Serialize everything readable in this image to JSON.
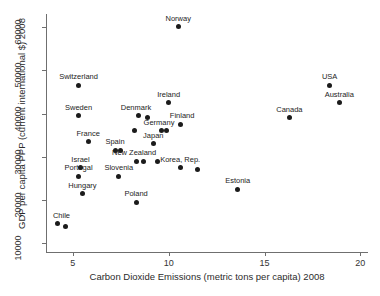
{
  "chart_data": {
    "type": "scatter",
    "title": "",
    "xlabel": "Carbon Dioxide Emissions (metric tons per capita) 2008",
    "ylabel": "GDP per capita PPP (current international $) 2008",
    "xlim": [
      3.6,
      20.4
    ],
    "ylim": [
      8000,
      63000
    ],
    "xticks": [
      5,
      10,
      15,
      20
    ],
    "xticklabels": [
      "5",
      "10",
      "15",
      "20"
    ],
    "yticks": [
      10000,
      20000,
      30000,
      40000,
      50000,
      60000
    ],
    "yticklabels": [
      "10000",
      "20000",
      "30000",
      "40000",
      "50000",
      "60000"
    ],
    "grid": false,
    "legend": "none",
    "marker": "filled-circle",
    "marker_color": "#1b1b1b",
    "points": [
      {
        "label": "Norway",
        "x": 10.5,
        "y": 60000,
        "label_dx": 0,
        "label_dy": -4
      },
      {
        "label": "Switzerland",
        "x": 5.3,
        "y": 46500,
        "label_dx": 0,
        "label_dy": -4
      },
      {
        "label": "USA",
        "x": 18.4,
        "y": 46500,
        "label_dx": 0,
        "label_dy": -4
      },
      {
        "label": "Ireland",
        "x": 10.0,
        "y": 42500,
        "label_dx": 0,
        "label_dy": -4
      },
      {
        "label": "Australia",
        "x": 18.9,
        "y": 42500,
        "label_dx": 0,
        "label_dy": -4
      },
      {
        "label": "Sweden",
        "x": 5.3,
        "y": 39500,
        "label_dx": 0,
        "label_dy": -4
      },
      {
        "label": "Canada",
        "x": 16.3,
        "y": 39000,
        "label_dx": 0,
        "label_dy": -4
      },
      {
        "label": "Denmark",
        "x": 8.4,
        "y": 39500,
        "label_dx": -2,
        "label_dy": -4
      },
      {
        "label": "",
        "x": 8.9,
        "y": 39000,
        "label_dx": 0,
        "label_dy": 0
      },
      {
        "label": "Finland",
        "x": 10.6,
        "y": 37500,
        "label_dx": 2,
        "label_dy": -4
      },
      {
        "label": "Germany",
        "x": 9.6,
        "y": 36000,
        "label_dx": -2,
        "label_dy": -4
      },
      {
        "label": "",
        "x": 9.9,
        "y": 36000,
        "label_dx": 0,
        "label_dy": 0
      },
      {
        "label": "",
        "x": 8.2,
        "y": 36000,
        "label_dx": 0,
        "label_dy": 0
      },
      {
        "label": "France",
        "x": 5.8,
        "y": 33500,
        "label_dx": 0,
        "label_dy": -4
      },
      {
        "label": "Japan",
        "x": 9.2,
        "y": 33000,
        "label_dx": 0,
        "label_dy": -4
      },
      {
        "label": "Spain",
        "x": 7.2,
        "y": 31500,
        "label_dx": 0,
        "label_dy": -4
      },
      {
        "label": "",
        "x": 7.5,
        "y": 31500,
        "label_dx": 0,
        "label_dy": 0
      },
      {
        "label": "New Zealand",
        "x": 8.3,
        "y": 29000,
        "label_dx": -2,
        "label_dy": -4
      },
      {
        "label": "",
        "x": 8.7,
        "y": 29000,
        "label_dx": 0,
        "label_dy": 0
      },
      {
        "label": "",
        "x": 9.4,
        "y": 29000,
        "label_dx": 0,
        "label_dy": 0
      },
      {
        "label": "Israel",
        "x": 5.4,
        "y": 27500,
        "label_dx": 0,
        "label_dy": -4
      },
      {
        "label": "Korea, Rep.",
        "x": 10.6,
        "y": 27500,
        "label_dx": 0,
        "label_dy": -4
      },
      {
        "label": "",
        "x": 11.5,
        "y": 27000,
        "label_dx": 0,
        "label_dy": 0
      },
      {
        "label": "Portugal",
        "x": 5.3,
        "y": 25500,
        "label_dx": 0,
        "label_dy": -4
      },
      {
        "label": "Slovenia",
        "x": 7.4,
        "y": 25500,
        "label_dx": 0,
        "label_dy": -4
      },
      {
        "label": "Hungary",
        "x": 5.5,
        "y": 21500,
        "label_dx": 0,
        "label_dy": -4
      },
      {
        "label": "Estonia",
        "x": 13.6,
        "y": 22500,
        "label_dx": 0,
        "label_dy": -4
      },
      {
        "label": "Poland",
        "x": 8.3,
        "y": 19500,
        "label_dx": 0,
        "label_dy": -4
      },
      {
        "label": "Chile",
        "x": 4.2,
        "y": 14500,
        "label_dx": 4,
        "label_dy": -4
      },
      {
        "label": "",
        "x": 4.6,
        "y": 14000,
        "label_dx": 0,
        "label_dy": 0
      }
    ]
  }
}
